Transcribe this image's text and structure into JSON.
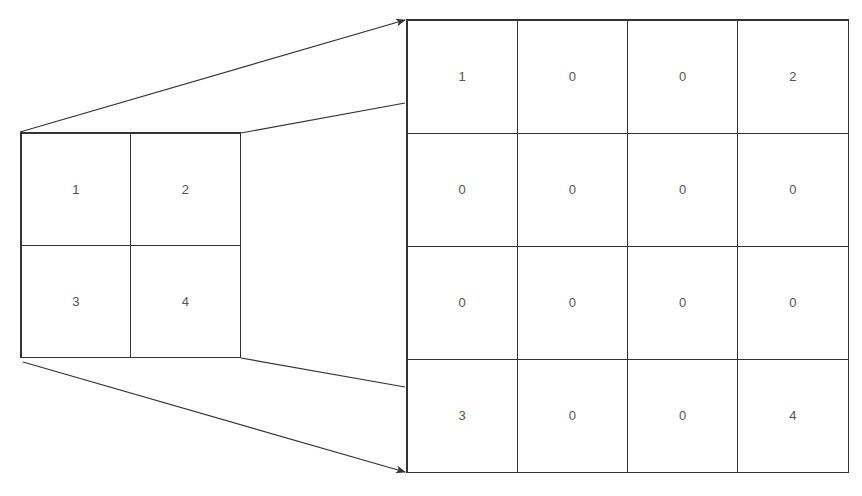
{
  "diagram": {
    "type": "matrix-upsampling-zero-insertion",
    "colors": {
      "line": "#333333",
      "text": "#555555",
      "background": "#ffffff"
    },
    "input_matrix": {
      "rows": 2,
      "cols": 2,
      "cells": [
        "1",
        "2",
        "3",
        "4"
      ]
    },
    "output_matrix": {
      "rows": 4,
      "cols": 4,
      "cells": [
        "1",
        "0",
        "0",
        "2",
        "0",
        "0",
        "0",
        "0",
        "0",
        "0",
        "0",
        "0",
        "3",
        "0",
        "0",
        "4"
      ]
    },
    "connectors": [
      {
        "name": "top-arrow",
        "from": [
          20,
          132
        ],
        "to": [
          405,
          20
        ],
        "arrow": true
      },
      {
        "name": "top-line",
        "from": [
          241,
          133
        ],
        "to": [
          405,
          103
        ],
        "arrow": false
      },
      {
        "name": "bottom-line",
        "from": [
          241,
          358
        ],
        "to": [
          405,
          387
        ],
        "arrow": false
      },
      {
        "name": "bottom-arrow",
        "from": [
          23,
          362
        ],
        "to": [
          405,
          472
        ],
        "arrow": true
      }
    ]
  }
}
